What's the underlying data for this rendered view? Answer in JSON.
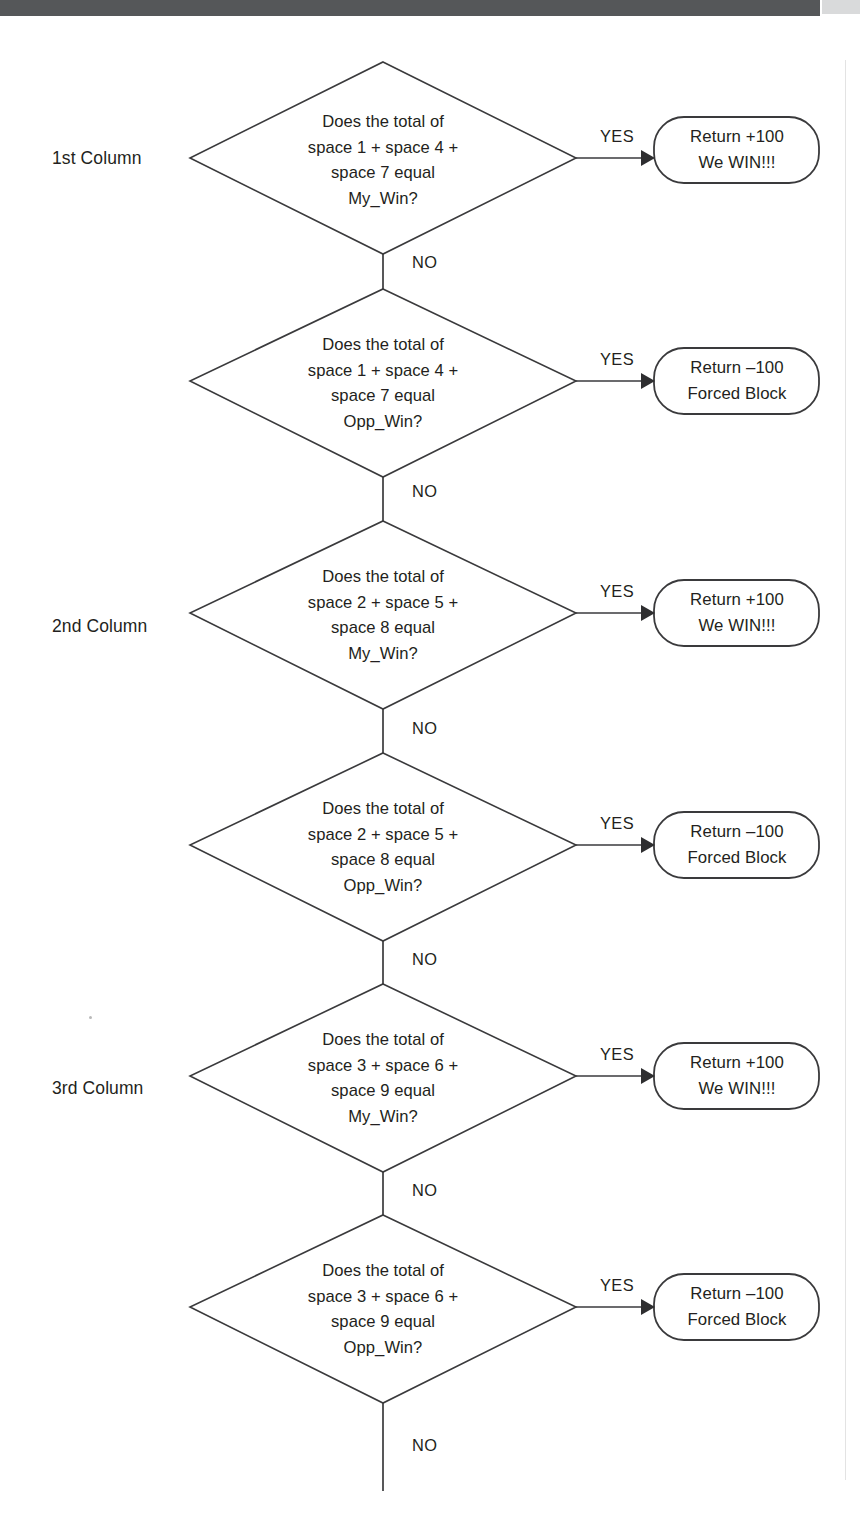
{
  "page": {
    "width": 860,
    "height": 1537,
    "background_color": "#ffffff",
    "ink_color": "#231f20",
    "line_color": "#3a3a3c",
    "header_band_color": "#555759",
    "header_band_tail_color": "#d9dadb"
  },
  "column_labels": [
    {
      "id": "col-1",
      "text": "1st Column",
      "x": 52,
      "y": 158
    },
    {
      "id": "col-2",
      "text": "2nd Column",
      "x": 52,
      "y": 626
    },
    {
      "id": "col-3",
      "text": "3rd Column",
      "x": 52,
      "y": 1088
    }
  ],
  "edge_labels": {
    "yes": "YES",
    "no": "NO"
  },
  "nodes": [
    {
      "id": "decision-1",
      "group": "1st Column",
      "shape": "diamond",
      "cx": 383,
      "cy": 158,
      "rx": 193,
      "ry": 96,
      "lines": [
        "Does the total of",
        "space 1 + space 4 +",
        "space 7 equal",
        "My_Win?"
      ],
      "yes_label": "YES",
      "no_label": "NO",
      "yes_target": "terminal-1",
      "no_target": "decision-2"
    },
    {
      "id": "terminal-1",
      "shape": "rounded-rect",
      "x": 654,
      "y": 117,
      "w": 165,
      "h": 66,
      "r": 30,
      "lines": [
        "Return +100",
        "We WIN!!!"
      ]
    },
    {
      "id": "decision-2",
      "group": "1st Column",
      "shape": "diamond",
      "cx": 383,
      "cy": 381,
      "rx": 193,
      "ry": 96,
      "lines": [
        "Does the total of",
        "space 1 + space 4 +",
        "space 7 equal",
        "Opp_Win?"
      ],
      "yes_label": "YES",
      "no_label": "NO",
      "yes_target": "terminal-2",
      "no_target": "decision-3"
    },
    {
      "id": "terminal-2",
      "shape": "rounded-rect",
      "x": 654,
      "y": 348,
      "w": 165,
      "h": 66,
      "r": 30,
      "lines": [
        "Return –100",
        "Forced Block"
      ]
    },
    {
      "id": "decision-3",
      "group": "2nd Column",
      "shape": "diamond",
      "cx": 383,
      "cy": 613,
      "rx": 193,
      "ry": 96,
      "lines": [
        "Does the total of",
        "space 2 + space 5 +",
        "space 8 equal",
        "My_Win?"
      ],
      "yes_label": "YES",
      "no_label": "NO",
      "yes_target": "terminal-3",
      "no_target": "decision-4"
    },
    {
      "id": "terminal-3",
      "shape": "rounded-rect",
      "x": 654,
      "y": 580,
      "w": 165,
      "h": 66,
      "r": 30,
      "lines": [
        "Return +100",
        "We WIN!!!"
      ]
    },
    {
      "id": "decision-4",
      "group": "2nd Column",
      "shape": "diamond",
      "cx": 383,
      "cy": 845,
      "rx": 193,
      "ry": 96,
      "lines": [
        "Does the total of",
        "space 2 + space 5 +",
        "space 8 equal",
        "Opp_Win?"
      ],
      "yes_label": "YES",
      "no_label": "NO",
      "yes_target": "terminal-4",
      "no_target": "decision-5"
    },
    {
      "id": "terminal-4",
      "shape": "rounded-rect",
      "x": 654,
      "y": 812,
      "w": 165,
      "h": 66,
      "r": 30,
      "lines": [
        "Return –100",
        "Forced Block"
      ]
    },
    {
      "id": "decision-5",
      "group": "3rd Column",
      "shape": "diamond",
      "cx": 383,
      "cy": 1076,
      "rx": 193,
      "ry": 96,
      "lines": [
        "Does the total of",
        "space 3 + space 6 +",
        "space 9 equal",
        "My_Win?"
      ],
      "yes_label": "YES",
      "no_label": "NO",
      "yes_target": "terminal-5",
      "no_target": "decision-6"
    },
    {
      "id": "terminal-5",
      "shape": "rounded-rect",
      "x": 654,
      "y": 1043,
      "w": 165,
      "h": 66,
      "r": 30,
      "lines": [
        "Return +100",
        "We WIN!!!"
      ]
    },
    {
      "id": "decision-6",
      "group": "3rd Column",
      "shape": "diamond",
      "cx": 383,
      "cy": 1307,
      "rx": 193,
      "ry": 96,
      "lines": [
        "Does the total of",
        "space 3 + space 6 +",
        "space 9 equal",
        "Opp_Win?"
      ],
      "yes_label": "YES",
      "no_label": "NO",
      "yes_target": "terminal-6",
      "no_target": null
    },
    {
      "id": "terminal-6",
      "shape": "rounded-rect",
      "x": 654,
      "y": 1274,
      "w": 165,
      "h": 66,
      "r": 30,
      "lines": [
        "Return –100",
        "Forced Block"
      ]
    }
  ],
  "text": {
    "d1": {
      "l1": "Does the total of",
      "l2": "space 1 + space 4 +",
      "l3": "space 7 equal",
      "l4": "My_Win?"
    },
    "d2": {
      "l1": "Does the total of",
      "l2": "space 1 + space 4 +",
      "l3": "space 7 equal",
      "l4": "Opp_Win?"
    },
    "d3": {
      "l1": "Does the total of",
      "l2": "space 2 + space 5 +",
      "l3": "space 8 equal",
      "l4": "My_Win?"
    },
    "d4": {
      "l1": "Does the total of",
      "l2": "space 2 + space 5 +",
      "l3": "space 8 equal",
      "l4": "Opp_Win?"
    },
    "d5": {
      "l1": "Does the total of",
      "l2": "space 3 + space 6 +",
      "l3": "space 9 equal",
      "l4": "My_Win?"
    },
    "d6": {
      "l1": "Does the total of",
      "l2": "space 3 + space 6 +",
      "l3": "space 9 equal",
      "l4": "Opp_Win?"
    },
    "t1": {
      "l1": "Return +100",
      "l2": "We WIN!!!"
    },
    "t2": {
      "l1": "Return –100",
      "l2": "Forced Block"
    },
    "t3": {
      "l1": "Return +100",
      "l2": "We WIN!!!"
    },
    "t4": {
      "l1": "Return –100",
      "l2": "Forced Block"
    },
    "t5": {
      "l1": "Return +100",
      "l2": "We WIN!!!"
    },
    "t6": {
      "l1": "Return –100",
      "l2": "Forced Block"
    }
  }
}
